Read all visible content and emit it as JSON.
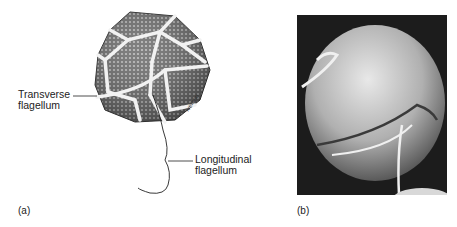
{
  "figure": {
    "panel_a": {
      "tag": "(a)",
      "labels": {
        "transverse": [
          "Transverse",
          "flagellum"
        ],
        "longitudinal": [
          "Longitudinal",
          "flagellum"
        ]
      },
      "signature": "Iverson"
    },
    "panel_b": {
      "tag": "(b)"
    }
  }
}
